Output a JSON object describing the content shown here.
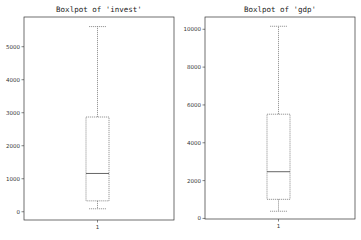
{
  "chart_data": [
    {
      "type": "box",
      "title": "Boxlpot of 'invest'",
      "xlabel": "",
      "ylabel": "",
      "categories": [
        "1"
      ],
      "ylim": [
        -250,
        5900
      ],
      "yticks": [
        0,
        1000,
        2000,
        3000,
        4000,
        5000
      ],
      "ytick_labels": [
        "0",
        "1000",
        "2000",
        "3000",
        "4000",
        "5000"
      ],
      "grid": false,
      "box": {
        "whisker_low": 90,
        "q1": 330,
        "median": 1160,
        "q3": 2870,
        "whisker_high": 5610
      }
    },
    {
      "type": "box",
      "title": "Boxlpot of 'gdp'",
      "xlabel": "",
      "ylabel": "",
      "categories": [
        "1"
      ],
      "ylim": [
        -30,
        10650
      ],
      "yticks": [
        0,
        2000,
        4000,
        6000,
        8000,
        10000
      ],
      "ytick_labels": [
        "0",
        "2000",
        "4000",
        "6000",
        "8000",
        "10000"
      ],
      "grid": false,
      "box": {
        "whisker_low": 380,
        "q1": 1010,
        "median": 2470,
        "q3": 5510,
        "whisker_high": 10160
      }
    }
  ]
}
